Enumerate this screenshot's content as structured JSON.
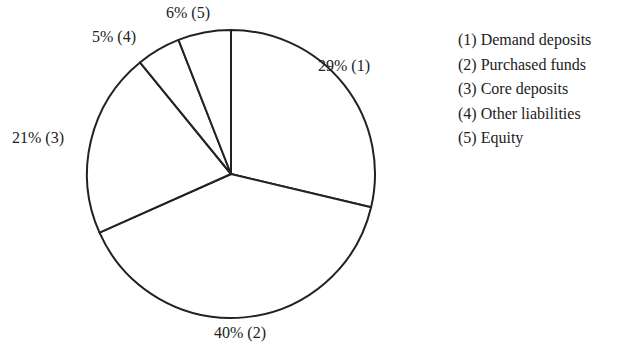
{
  "chart_data": {
    "type": "pie",
    "title": "",
    "categories": [
      "Demand deposits",
      "Purchased funds",
      "Core deposits",
      "Other liabilities",
      "Equity"
    ],
    "values": [
      29,
      40,
      21,
      5,
      6
    ],
    "unit": "%",
    "slice_labels": [
      "29% (1)",
      "40% (2)",
      "21% (3)",
      "5% (4)",
      "6% (5)"
    ],
    "legend": [
      "(1) Demand deposits",
      "(2) Purchased funds",
      "(3) Core deposits",
      "(4) Other liabilities",
      "(5) Equity"
    ],
    "legend_position": "right",
    "start_angle_deg": -90,
    "direction": "clockwise",
    "fill_color": "#ffffff",
    "stroke_color": "#222222"
  }
}
